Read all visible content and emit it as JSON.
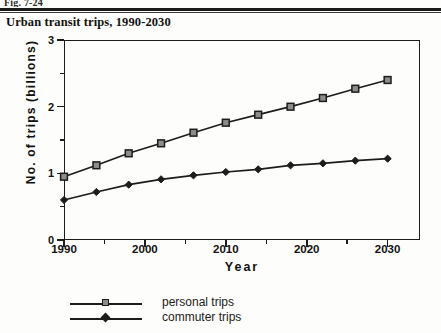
{
  "figure": {
    "running_head": "Fig. 7-24",
    "title": "Urban transit trips, 1990-2030"
  },
  "axes": {
    "y_label": "No.  of  trips  (billions)",
    "x_label": "Year",
    "y_ticks": [
      "0",
      "1",
      "2",
      "3"
    ],
    "x_ticks": [
      "1990",
      "2000",
      "2010",
      "2020",
      "2030"
    ]
  },
  "legend": {
    "items": [
      {
        "label": "personal trips",
        "marker": "square-marker",
        "color": "#1c1c1c"
      },
      {
        "label": "commuter trips",
        "marker": "diamond-marker",
        "color": "#1c1c1c"
      }
    ]
  },
  "chart_data": {
    "type": "line",
    "title": "Urban transit trips, 1990-2030",
    "xlabel": "Year",
    "ylabel": "No. of trips (billions)",
    "xlim": [
      1990,
      2034
    ],
    "ylim": [
      0,
      3
    ],
    "grid": false,
    "legend_position": "below",
    "x": [
      1990,
      1994,
      1998,
      2002,
      2006,
      2010,
      2014,
      2018,
      2022,
      2026,
      2030
    ],
    "x_tick_values": [
      1990,
      2000,
      2010,
      2020,
      2030
    ],
    "x_minor_tick_values": [
      1995,
      2005,
      2015,
      2025
    ],
    "y_tick_values": [
      0,
      1,
      2,
      3
    ],
    "y_minor_tick_values": [
      0.5,
      1.5,
      2.5
    ],
    "series": [
      {
        "name": "personal trips",
        "marker": "square",
        "values": [
          0.95,
          1.12,
          1.3,
          1.45,
          1.61,
          1.76,
          1.88,
          2.0,
          2.13,
          2.27,
          2.4
        ]
      },
      {
        "name": "commuter trips",
        "marker": "diamond",
        "values": [
          0.6,
          0.72,
          0.83,
          0.91,
          0.97,
          1.02,
          1.06,
          1.12,
          1.15,
          1.19,
          1.22
        ]
      }
    ]
  }
}
